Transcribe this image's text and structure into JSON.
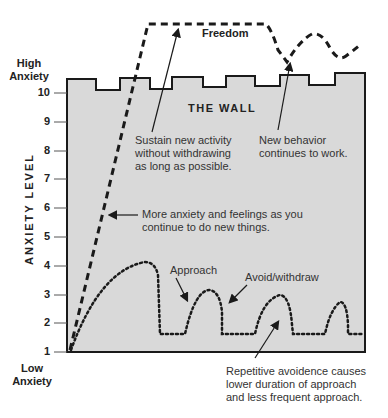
{
  "diagram": {
    "title_label": "THE WALL",
    "freedom_label": "Freedom",
    "y_axis": {
      "label": "ANXIETY LEVEL",
      "top_label_line1": "High",
      "top_label_line2": "Anxiety",
      "bottom_label_line1": "Low",
      "bottom_label_line2": "Anxiety",
      "ticks": [
        "10",
        "9",
        "8",
        "7",
        "6",
        "5",
        "4",
        "3",
        "2",
        "1"
      ]
    },
    "annotations": {
      "sustain": [
        "Sustain new activity",
        "without withdrawing",
        "as long as possible."
      ],
      "new_behavior": [
        "New behavior",
        "continues to work."
      ],
      "more_anxiety": [
        "More anxiety and feelings as you",
        "continue to do new things."
      ],
      "approach": "Approach",
      "avoid": "Avoid/withdraw",
      "repetitive": [
        "Repetitive avoidence causes",
        "lower duration of approach",
        "and less frequent approach."
      ]
    },
    "colors": {
      "wall_fill": "#d9d9d9",
      "line": "#1a1a1a",
      "background": "#ffffff"
    }
  }
}
